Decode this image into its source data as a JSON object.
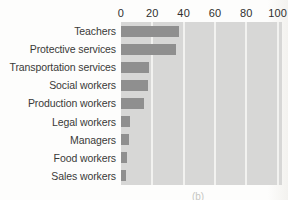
{
  "figure": {
    "caption": "(b)"
  },
  "chart_data": {
    "type": "bar",
    "orientation": "horizontal",
    "title": "",
    "xlabel": "",
    "ylabel": "",
    "categories": [
      "Teachers",
      "Protective services",
      "Transportation services",
      "Social workers",
      "Production workers",
      "Legal workers",
      "Managers",
      "Food workers",
      "Sales workers"
    ],
    "values": [
      37,
      35,
      18,
      17,
      15,
      6,
      5,
      4,
      3
    ],
    "xlim": [
      0,
      100
    ],
    "xticks": [
      0,
      20,
      40,
      60,
      80,
      100
    ],
    "axis_position": "top",
    "grid": true,
    "legend": "none",
    "colors": {
      "bar": "#8f8f8f",
      "plot_background": "#d7d7d6",
      "gridline": "#f2f2f0",
      "tick_text": "#2f2f2e",
      "label_text": "#3a3a38",
      "caption_text": "#b4b4ae"
    }
  }
}
